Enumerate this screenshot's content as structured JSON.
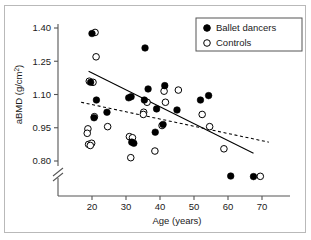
{
  "chart_data": {
    "type": "scatter",
    "title": "",
    "xlabel": "Age (years)",
    "ylabel": "aBMD (g/cm2)",
    "ylabel_prefix": "aBMD (g/cm",
    "ylabel_sup": "2",
    "ylabel_suffix": ")",
    "xlim": [
      14,
      74
    ],
    "ylim": [
      0.8,
      1.4
    ],
    "xticks": [
      20,
      30,
      40,
      50,
      60,
      70
    ],
    "xticklabels": [
      "20",
      "30",
      "40",
      "50",
      "60",
      "70"
    ],
    "yticks": [
      0.8,
      0.95,
      1.1,
      1.25,
      1.4
    ],
    "yticklabels": [
      "0.80",
      "0.95",
      "1.10",
      "1.25",
      "1.40"
    ],
    "grid": false,
    "axis_break": {
      "axis": "y",
      "present": true,
      "note": "y-axis broken below 0.80; points below break drawn in detached zone"
    },
    "legend": {
      "position": "top-right",
      "entries": [
        {
          "label": "Ballet dancers",
          "marker": "filled-circle"
        },
        {
          "label": "Controls",
          "marker": "open-circle"
        }
      ]
    },
    "series": [
      {
        "name": "Ballet dancers",
        "marker": "filled-circle",
        "color": "#000000",
        "points": [
          {
            "x": 20.0,
            "y": 1.375
          },
          {
            "x": 19.6,
            "y": 1.155
          },
          {
            "x": 21.3,
            "y": 1.075
          },
          {
            "x": 20.6,
            "y": 0.995
          },
          {
            "x": 24.4,
            "y": 1.02
          },
          {
            "x": 30.8,
            "y": 1.085
          },
          {
            "x": 31.5,
            "y": 1.09
          },
          {
            "x": 32.3,
            "y": 0.88
          },
          {
            "x": 31.7,
            "y": 0.885
          },
          {
            "x": 35.6,
            "y": 1.31
          },
          {
            "x": 35.4,
            "y": 1.075
          },
          {
            "x": 36.5,
            "y": 1.125
          },
          {
            "x": 38.6,
            "y": 0.93
          },
          {
            "x": 39.0,
            "y": 1.035
          },
          {
            "x": 40.9,
            "y": 0.965
          },
          {
            "x": 41.4,
            "y": 1.14
          },
          {
            "x": 45.0,
            "y": 1.03
          },
          {
            "x": 51.9,
            "y": 1.075
          },
          {
            "x": 54.3,
            "y": 1.095
          },
          {
            "x": 60.8,
            "y": 0.69
          },
          {
            "x": 67.5,
            "y": 0.68
          }
        ]
      },
      {
        "name": "Controls",
        "marker": "open-circle",
        "color": "#000000",
        "points": [
          {
            "x": 20.9,
            "y": 1.38
          },
          {
            "x": 21.2,
            "y": 1.27
          },
          {
            "x": 19.2,
            "y": 1.16
          },
          {
            "x": 20.3,
            "y": 1.155
          },
          {
            "x": 20.7,
            "y": 1.0
          },
          {
            "x": 18.8,
            "y": 0.945
          },
          {
            "x": 18.6,
            "y": 0.925
          },
          {
            "x": 19.0,
            "y": 0.875
          },
          {
            "x": 19.9,
            "y": 0.88
          },
          {
            "x": 19.5,
            "y": 0.87
          },
          {
            "x": 24.6,
            "y": 0.955
          },
          {
            "x": 31.0,
            "y": 0.91
          },
          {
            "x": 31.9,
            "y": 0.905
          },
          {
            "x": 31.4,
            "y": 0.815
          },
          {
            "x": 35.2,
            "y": 1.02
          },
          {
            "x": 35.1,
            "y": 1.01
          },
          {
            "x": 36.2,
            "y": 1.065
          },
          {
            "x": 38.5,
            "y": 0.845
          },
          {
            "x": 40.6,
            "y": 0.96
          },
          {
            "x": 41.2,
            "y": 1.115
          },
          {
            "x": 41.6,
            "y": 1.065
          },
          {
            "x": 45.4,
            "y": 1.12
          },
          {
            "x": 52.4,
            "y": 1.01
          },
          {
            "x": 54.6,
            "y": 0.955
          },
          {
            "x": 58.8,
            "y": 0.855
          },
          {
            "x": 69.5,
            "y": 0.685
          }
        ]
      }
    ],
    "trend_lines": [
      {
        "name": "Ballet dancers regression",
        "style": "solid",
        "x_start": 19.0,
        "y_start": 1.205,
        "x_end": 67.5,
        "y_end": 0.835
      },
      {
        "name": "Controls regression",
        "style": "dashed",
        "x_start": 16.8,
        "y_start": 1.065,
        "x_end": 72.0,
        "y_end": 0.885
      }
    ]
  }
}
